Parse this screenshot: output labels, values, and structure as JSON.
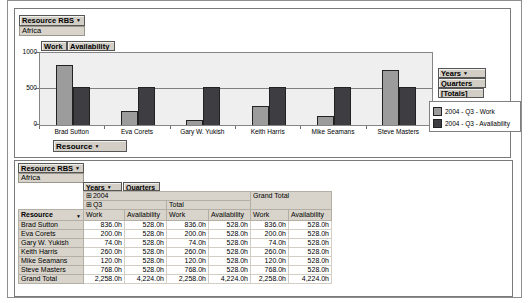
{
  "icons": {
    "dropdown": "▼",
    "expand": "⊞"
  },
  "colors": {
    "work_series": "#9c9c9c",
    "availability_series": "#3d3d42",
    "plot_background": "#efefef",
    "button_gray": "#d2cec6",
    "header_gray": "#d8d4cb"
  },
  "chart_panel": {
    "rbs_field": {
      "label": "Resource RBS",
      "value": "Africa"
    },
    "series_field_buttons": {
      "work": "Work",
      "availability": "Availability"
    },
    "category_field_button": "Resource",
    "right_field_buttons": {
      "years": "Years",
      "quarters": "Quarters",
      "totals": "[Totals]"
    }
  },
  "chart_data": {
    "type": "bar",
    "title": "",
    "categories": [
      "Brad Sutton",
      "Eva Corets",
      "Gary W. Yukish",
      "Keith Harris",
      "Mike Seamans",
      "Steve Masters"
    ],
    "series": [
      {
        "name": "2004 - Q3 - Work",
        "color": "#9c9c9c",
        "values": [
          836,
          200,
          74,
          260,
          120,
          768
        ]
      },
      {
        "name": "2004 - Q3 - Availability",
        "color": "#3d3d42",
        "values": [
          528,
          528,
          528,
          528,
          528,
          528
        ]
      }
    ],
    "ylim": [
      0,
      1000
    ],
    "yticks": [
      0,
      500,
      1000
    ],
    "unit": "hours",
    "grid": "horizontal gridline at 500",
    "legend_position": "right"
  },
  "table_panel": {
    "rbs_field": {
      "label": "Resource RBS",
      "value": "Africa"
    },
    "field_buttons": {
      "years": "Years",
      "quarters": "Quarters"
    },
    "col_groups": {
      "year": "2004",
      "quarter": "Q3",
      "total": "Total",
      "grand_total": "Grand Total"
    },
    "measure_headers": {
      "work": "Work",
      "availability": "Availability"
    },
    "row_header": "Resource",
    "rows": [
      {
        "name": "Brad Sutton",
        "values": [
          "836.0h",
          "528.0h",
          "836.0h",
          "528.0h",
          "836.0h",
          "528.0h"
        ]
      },
      {
        "name": "Eva Corets",
        "values": [
          "200.0h",
          "528.0h",
          "200.0h",
          "528.0h",
          "200.0h",
          "528.0h"
        ]
      },
      {
        "name": "Gary W. Yukish",
        "values": [
          "74.0h",
          "528.0h",
          "74.0h",
          "528.0h",
          "74.0h",
          "528.0h"
        ]
      },
      {
        "name": "Keith Harris",
        "values": [
          "260.0h",
          "528.0h",
          "260.0h",
          "528.0h",
          "260.0h",
          "528.0h"
        ]
      },
      {
        "name": "Mike Seamans",
        "values": [
          "120.0h",
          "528.0h",
          "120.0h",
          "528.0h",
          "120.0h",
          "528.0h"
        ]
      },
      {
        "name": "Steve Masters",
        "values": [
          "768.0h",
          "528.0h",
          "768.0h",
          "528.0h",
          "768.0h",
          "528.0h"
        ]
      },
      {
        "name": "Grand Total",
        "values": [
          "2,258.0h",
          "4,224.0h",
          "2,258.0h",
          "4,224.0h",
          "2,258.0h",
          "4,224.0h"
        ]
      }
    ]
  }
}
